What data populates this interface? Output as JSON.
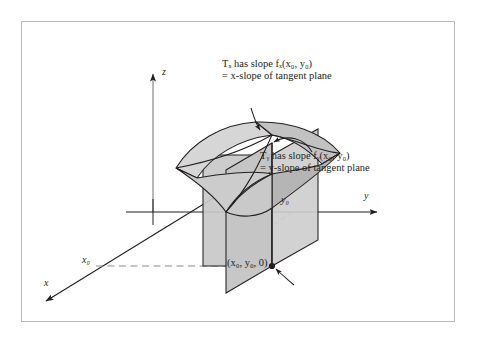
{
  "figure": {
    "type": "math-diagram",
    "annotations": {
      "tx": {
        "line1": "Tₓ has slope fₓ(x₀, y₀)",
        "line2": "= x-slope of tangent plane"
      },
      "ty": {
        "line1": "Tᵧ has slope fᵧ(x₀, y₀)",
        "line2": "= y-slope of tangent plane"
      },
      "base_point": "(x₀, y₀, 0)"
    },
    "axes": {
      "z": "z",
      "y": "y",
      "x": "x",
      "y_tick": "y₀",
      "x_tick": "x₀"
    },
    "colors": {
      "ink": "#231f20",
      "frame": "#b9b9b9",
      "surface_light": "#d3d3d3",
      "surface_mid": "#c0c0c0",
      "surface_dark": "#a9a9a9",
      "plane_fill": "#cfcfcf",
      "background": "#ffffff"
    }
  }
}
